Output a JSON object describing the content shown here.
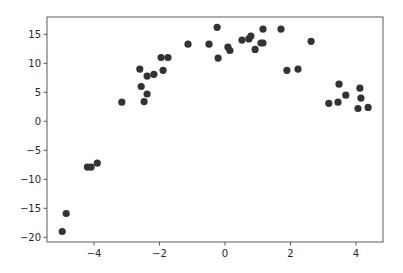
{
  "chart_data": {
    "type": "scatter",
    "title": "",
    "xlabel": "",
    "ylabel": "",
    "xlim": [
      -5.4,
      4.8
    ],
    "ylim": [
      -20.8,
      17.9
    ],
    "grid": false,
    "legend": null,
    "x_ticks": [
      -4,
      -2,
      0,
      2,
      4
    ],
    "x_tick_labels": [
      "−4",
      "−2",
      "0",
      "2",
      "4"
    ],
    "y_ticks": [
      -20,
      -15,
      -10,
      -5,
      0,
      5,
      10,
      15
    ],
    "y_tick_labels": [
      "−20",
      "−15",
      "−10",
      "−5",
      "0",
      "5",
      "10",
      "15"
    ],
    "marker_color": "#333333",
    "series": [
      {
        "name": "points",
        "points": [
          {
            "x": -4.97,
            "y": -19.0
          },
          {
            "x": -4.85,
            "y": -15.9
          },
          {
            "x": -4.2,
            "y": -7.9
          },
          {
            "x": -4.09,
            "y": -7.9
          },
          {
            "x": -3.9,
            "y": -7.2
          },
          {
            "x": -3.15,
            "y": 3.3
          },
          {
            "x": -2.6,
            "y": 9.0
          },
          {
            "x": -2.56,
            "y": 6.0
          },
          {
            "x": -2.47,
            "y": 3.4
          },
          {
            "x": -2.38,
            "y": 4.7
          },
          {
            "x": -2.38,
            "y": 7.8
          },
          {
            "x": -2.17,
            "y": 8.1
          },
          {
            "x": -1.95,
            "y": 11.0
          },
          {
            "x": -1.89,
            "y": 8.8
          },
          {
            "x": -1.74,
            "y": 11.0
          },
          {
            "x": -1.13,
            "y": 13.3
          },
          {
            "x": -0.49,
            "y": 13.3
          },
          {
            "x": -0.24,
            "y": 16.2
          },
          {
            "x": -0.21,
            "y": 10.9
          },
          {
            "x": 0.09,
            "y": 12.8
          },
          {
            "x": 0.15,
            "y": 12.2
          },
          {
            "x": 0.52,
            "y": 14.0
          },
          {
            "x": 0.73,
            "y": 14.2
          },
          {
            "x": 0.79,
            "y": 14.7
          },
          {
            "x": 0.92,
            "y": 12.4
          },
          {
            "x": 1.1,
            "y": 13.5
          },
          {
            "x": 1.16,
            "y": 13.5
          },
          {
            "x": 1.16,
            "y": 15.9
          },
          {
            "x": 1.71,
            "y": 15.9
          },
          {
            "x": 1.89,
            "y": 8.8
          },
          {
            "x": 2.23,
            "y": 9.0
          },
          {
            "x": 2.63,
            "y": 13.8
          },
          {
            "x": 3.17,
            "y": 3.1
          },
          {
            "x": 3.45,
            "y": 3.3
          },
          {
            "x": 3.48,
            "y": 6.4
          },
          {
            "x": 3.69,
            "y": 4.5
          },
          {
            "x": 4.06,
            "y": 2.2
          },
          {
            "x": 4.12,
            "y": 5.7
          },
          {
            "x": 4.15,
            "y": 4.0
          },
          {
            "x": 4.37,
            "y": 2.4
          }
        ]
      }
    ]
  },
  "layout": {
    "axes_px": {
      "left": 47,
      "top": 17,
      "right": 383,
      "bottom": 242
    },
    "x_px_per_unit": 32.75,
    "x_zero_px": 225,
    "y_px_per_unit": 5.8,
    "y_zero_px": 121.3,
    "marker_radius": 3.6
  }
}
